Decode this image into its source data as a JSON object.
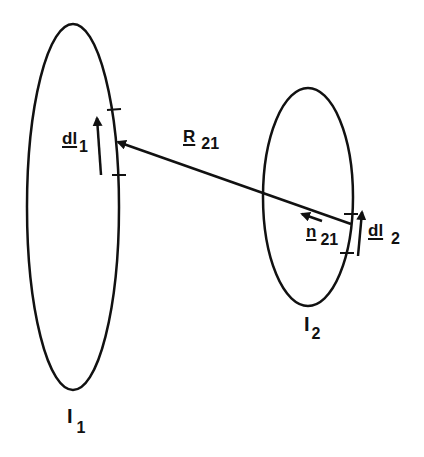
{
  "diagram": {
    "type": "two current loops with mutual inductance geometry",
    "colors": {
      "stroke": "#111111",
      "background": "#ffffff"
    },
    "loops": [
      {
        "id": "loop1",
        "label": "I",
        "subscript": "1",
        "cx": 73,
        "cy": 207,
        "rx": 46,
        "ry": 183
      },
      {
        "id": "loop2",
        "label": "I",
        "subscript": "2",
        "cx": 308,
        "cy": 197,
        "rx": 45,
        "ry": 109
      }
    ],
    "vectors": {
      "dl1": {
        "label": "dl",
        "subscript": "1"
      },
      "R21": {
        "label": "R",
        "subscript": "21"
      },
      "n21": {
        "label": "n",
        "subscript": "21"
      },
      "dl2": {
        "label": "dl",
        "subscript": "2"
      }
    }
  }
}
